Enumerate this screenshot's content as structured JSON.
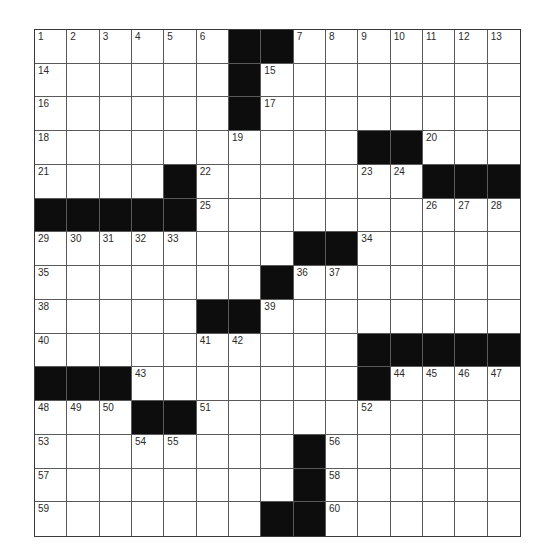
{
  "puzzle": {
    "rows": 15,
    "cols": 15,
    "colors": {
      "block": "#0d0d0d",
      "cell": "#ffffff",
      "gridline": "#5a5a5a",
      "number": "#2a2a2a"
    },
    "grid": [
      "......##.......",
      "......#........",
      "......#........",
      "..........##...",
      "....#.......###",
      "#####..........",
      "........##.....",
      ".......#.......",
      ".....##........",
      "..........#####",
      "###.......#....",
      "...##..........",
      "........#......",
      "........#......",
      ".......##......"
    ],
    "numbers": [
      [
        1,
        2,
        3,
        4,
        5,
        6,
        null,
        null,
        7,
        8,
        9,
        10,
        11,
        12,
        13
      ],
      [
        14,
        null,
        null,
        null,
        null,
        null,
        null,
        15,
        null,
        null,
        null,
        null,
        null,
        null,
        null
      ],
      [
        16,
        null,
        null,
        null,
        null,
        null,
        null,
        17,
        null,
        null,
        null,
        null,
        null,
        null,
        null
      ],
      [
        18,
        null,
        null,
        null,
        null,
        null,
        19,
        null,
        null,
        null,
        null,
        null,
        20,
        null,
        null
      ],
      [
        21,
        null,
        null,
        null,
        null,
        22,
        null,
        null,
        null,
        null,
        23,
        24,
        null,
        null,
        null
      ],
      [
        null,
        null,
        null,
        null,
        null,
        25,
        null,
        null,
        null,
        null,
        null,
        null,
        26,
        27,
        28
      ],
      [
        29,
        30,
        31,
        32,
        33,
        null,
        null,
        null,
        null,
        null,
        34,
        null,
        null,
        null,
        null
      ],
      [
        35,
        null,
        null,
        null,
        null,
        null,
        null,
        null,
        36,
        37,
        null,
        null,
        null,
        null,
        null
      ],
      [
        38,
        null,
        null,
        null,
        null,
        null,
        null,
        39,
        null,
        null,
        null,
        null,
        null,
        null,
        null
      ],
      [
        40,
        null,
        null,
        null,
        null,
        41,
        42,
        null,
        null,
        null,
        null,
        null,
        null,
        null,
        null
      ],
      [
        null,
        null,
        null,
        43,
        null,
        null,
        null,
        null,
        null,
        null,
        null,
        44,
        45,
        46,
        47
      ],
      [
        48,
        49,
        50,
        null,
        null,
        51,
        null,
        null,
        null,
        null,
        52,
        null,
        null,
        null,
        null
      ],
      [
        53,
        null,
        null,
        54,
        55,
        null,
        null,
        null,
        null,
        56,
        null,
        null,
        null,
        null,
        null
      ],
      [
        57,
        null,
        null,
        null,
        null,
        null,
        null,
        null,
        null,
        58,
        null,
        null,
        null,
        null,
        null
      ],
      [
        59,
        null,
        null,
        null,
        null,
        null,
        null,
        null,
        null,
        60,
        null,
        null,
        null,
        null,
        null
      ]
    ],
    "letters": []
  }
}
